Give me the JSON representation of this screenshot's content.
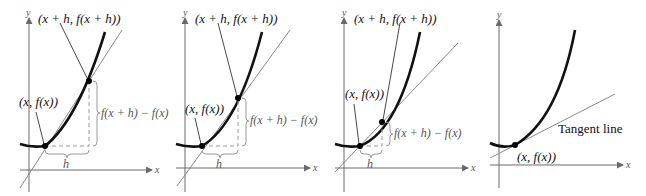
{
  "figure": {
    "panels": [
      {
        "id": "panel-1",
        "axis_x_label": "x",
        "axis_y_label": "y",
        "point_upper_label": "(x + h, f(x + h))",
        "point_lower_label": "(x, f(x))",
        "rise_label": "f(x + h) − f(x)",
        "run_label": "h"
      },
      {
        "id": "panel-2",
        "axis_x_label": "x",
        "axis_y_label": "y",
        "point_upper_label": "(x + h, f(x + h))",
        "point_lower_label": "(x, f(x))",
        "rise_label": "f(x + h) − f(x)",
        "run_label": "h"
      },
      {
        "id": "panel-3",
        "axis_x_label": "x",
        "axis_y_label": "y",
        "point_upper_label": "(x + h, f(x + h))",
        "point_lower_label": "(x, f(x))",
        "rise_label": "f(x + h) − f(x)",
        "run_label": "h"
      },
      {
        "id": "panel-4",
        "axis_x_label": "x",
        "axis_y_label": "y",
        "point_label": "(x, f(x))",
        "tangent_label": "Tangent line"
      }
    ]
  }
}
